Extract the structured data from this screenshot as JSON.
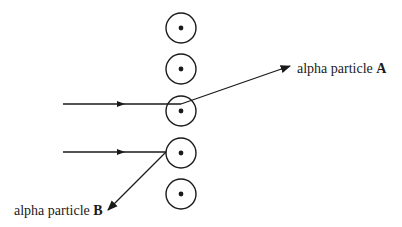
{
  "diagram": {
    "type": "rutherford-scattering",
    "nuclei": [
      {
        "cx": 181,
        "cy": 28
      },
      {
        "cx": 181,
        "cy": 69
      },
      {
        "cx": 181,
        "cy": 111
      },
      {
        "cx": 181,
        "cy": 153
      },
      {
        "cx": 181,
        "cy": 194
      }
    ],
    "nucleus_radius": 15,
    "particles": [
      {
        "name": "A",
        "prefix": "alpha particle ",
        "letter": "A"
      },
      {
        "name": "B",
        "prefix": "alpha particle ",
        "letter": "B"
      }
    ],
    "colors": {
      "stroke": "#1a1a1a",
      "background": "#ffffff"
    }
  }
}
